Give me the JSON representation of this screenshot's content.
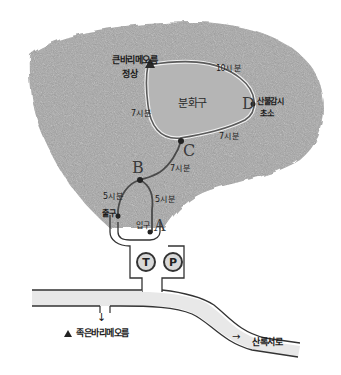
{
  "map": {
    "title_peak": "큰바리메오름",
    "peak_label_line1": "큰바리메오름",
    "peak_label_line2": "정상",
    "crater_label": "분화구",
    "points": {
      "A": {
        "letter": "A"
      },
      "B": {
        "letter": "B"
      },
      "C": {
        "letter": "C"
      },
      "D": {
        "letter": "D",
        "label_line1": "산불감시",
        "label_line2": "초소"
      }
    },
    "segments": {
      "top_right": "10시 분",
      "c_to_peak": "7시 분",
      "c_to_d": "7시 분",
      "b_to_c": "7시 분",
      "exit_to_b": "5시 분",
      "a_to_b": "5시 분"
    },
    "entrance_label": "입구",
    "exit_label": "출구",
    "facilities": [
      {
        "id": "toilet",
        "symbol": "T",
        "meaning": "화장실"
      },
      {
        "id": "parking",
        "symbol": "P",
        "meaning": "주차장"
      }
    ],
    "road": {
      "left_destination": "족은바리메오름",
      "right_destination": "산록서로",
      "left_arrow": "↓",
      "right_arrow": "→",
      "peak_marker": "▲"
    },
    "colors": {
      "terrain_fill": "#a8a8a8",
      "terrain_dark": "#7a7a7a",
      "trail": "#4a4a4a",
      "crater_fill": "#b5b5b5",
      "ink": "#1a1a1a",
      "road_fill": "#e6e6e6"
    }
  }
}
